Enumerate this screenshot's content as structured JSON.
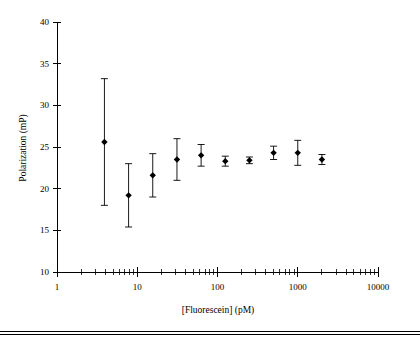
{
  "figure": {
    "background_color": "#ffffff",
    "ink_color": "#000000",
    "footer_rule_visible": true
  },
  "chart_data": {
    "type": "scatter",
    "title": "",
    "subtitle": "",
    "xlabel": "[Fluorescein] (pM)",
    "ylabel": "Polarization (mP)",
    "xscale": "log",
    "yscale": "linear",
    "xlim": [
      1,
      10000
    ],
    "ylim": [
      10,
      40
    ],
    "grid": false,
    "legend": null,
    "legend_position": "none",
    "marker": "filled-diamond",
    "error_bars": "symmetric-vertical",
    "x_tick_labels": [
      "1",
      "10",
      "100",
      "1000",
      "10000"
    ],
    "x_tick_values": [
      1,
      10,
      100,
      1000,
      10000
    ],
    "x_minor_ticks": true,
    "y_tick_labels": [
      "10",
      "15",
      "20",
      "25",
      "30",
      "35",
      "40"
    ],
    "y_tick_values": [
      10,
      15,
      20,
      25,
      30,
      35,
      40
    ],
    "x": [
      3.9,
      7.8,
      15.6,
      31.25,
      62.5,
      125,
      250,
      500,
      1000,
      2000
    ],
    "values": [
      25.6,
      19.2,
      21.6,
      23.5,
      24.0,
      23.3,
      23.4,
      24.3,
      24.3,
      23.5
    ],
    "yerr": [
      7.6,
      3.8,
      2.6,
      2.5,
      1.3,
      0.6,
      0.4,
      0.8,
      1.5,
      0.6
    ],
    "points": [
      {
        "x": 3.9,
        "y": 25.6,
        "err": 7.6,
        "low": 18.0,
        "high": 33.2
      },
      {
        "x": 7.8,
        "y": 19.2,
        "err": 3.8,
        "low": 15.4,
        "high": 23.0
      },
      {
        "x": 15.6,
        "y": 21.6,
        "err": 2.6,
        "low": 19.0,
        "high": 24.2
      },
      {
        "x": 31.25,
        "y": 23.5,
        "err": 2.5,
        "low": 21.0,
        "high": 26.0
      },
      {
        "x": 62.5,
        "y": 24.0,
        "err": 1.3,
        "low": 22.7,
        "high": 25.3
      },
      {
        "x": 125,
        "y": 23.3,
        "err": 0.6,
        "low": 22.7,
        "high": 23.9
      },
      {
        "x": 250,
        "y": 23.4,
        "err": 0.4,
        "low": 23.0,
        "high": 23.8
      },
      {
        "x": 500,
        "y": 24.3,
        "err": 0.8,
        "low": 23.5,
        "high": 25.1
      },
      {
        "x": 1000,
        "y": 24.3,
        "err": 1.5,
        "low": 22.8,
        "high": 25.8
      },
      {
        "x": 2000,
        "y": 23.5,
        "err": 0.6,
        "low": 22.9,
        "high": 24.1
      }
    ]
  }
}
